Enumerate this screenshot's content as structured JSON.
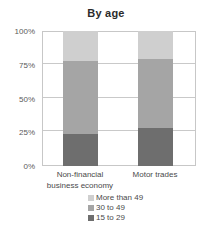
{
  "chart_data": {
    "type": "bar",
    "subtype": "stacked-percent",
    "title": "By age",
    "xlabel": "",
    "ylabel": "",
    "ylim": [
      0,
      100
    ],
    "ytick_labels": [
      "0%",
      "25%",
      "50%",
      "75%",
      "100%"
    ],
    "ytick_values": [
      0,
      25,
      50,
      75,
      100
    ],
    "grid": true,
    "legend_position": "bottom",
    "categories": [
      "Non-financial business economy",
      "Motor trades"
    ],
    "category_lines": [
      [
        "Non-financial",
        "business economy"
      ],
      [
        "Motor trades"
      ]
    ],
    "series": [
      {
        "name": "More than 49",
        "values": [
          22,
          21
        ],
        "color": "#cfcfcf"
      },
      {
        "name": "30 to 49",
        "values": [
          54,
          51
        ],
        "color": "#a5a5a5"
      },
      {
        "name": "15 to 29",
        "values": [
          24,
          28
        ],
        "color": "#6e6e6e"
      }
    ],
    "stack_order_bottom_to_top": [
      "15 to 29",
      "30 to 49",
      "More than 49"
    ]
  },
  "legend": {
    "items": [
      {
        "label": "More than 49",
        "color": "#cfcfcf"
      },
      {
        "label": "30 to 49",
        "color": "#a5a5a5"
      },
      {
        "label": "15 to 29",
        "color": "#6e6e6e"
      }
    ]
  },
  "axis": {
    "y": {
      "ticks": [
        {
          "label": "100%",
          "value": 100
        },
        {
          "label": "75%",
          "value": 75
        },
        {
          "label": "50%",
          "value": 50
        },
        {
          "label": "25%",
          "value": 25
        },
        {
          "label": "0%",
          "value": 0
        }
      ]
    }
  },
  "colors": {
    "grid": "#c9c9c9",
    "frame": "#c7c7c7",
    "text": "#4a4a4a",
    "title": "#2b2b2b"
  }
}
